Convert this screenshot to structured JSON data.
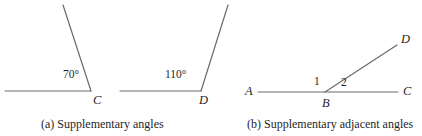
{
  "figure": {
    "background_color": "#ffffff",
    "stroke_color": "#6a6a6a",
    "text_color": "#1f1f1f",
    "panels": [
      {
        "id": "panel-a",
        "caption": "(a) Supplementary angles",
        "sub_figures": [
          {
            "id": "angle-70",
            "vertex_label": "C",
            "angle_measure": "70°",
            "angle_value": 70
          },
          {
            "id": "angle-110",
            "vertex_label": "D",
            "angle_measure": "110°",
            "angle_value": 110
          }
        ]
      },
      {
        "id": "panel-b",
        "caption": "(b) Supplementary adjacent angles",
        "sub_figures": [
          {
            "id": "adjacent-angles",
            "endpoint_left_label": "A",
            "vertex_label": "B",
            "endpoint_right_label": "C",
            "ray_label": "D",
            "angle_1_label": "1",
            "angle_2_label": "2"
          }
        ]
      }
    ]
  },
  "labels": {
    "a_angle_70": "70°",
    "a_vertex_c": "C",
    "a_angle_110": "110°",
    "a_vertex_d": "D",
    "b_point_a": "A",
    "b_point_b": "B",
    "b_point_c": "C",
    "b_point_d": "D",
    "b_angle_1": "1",
    "b_angle_2": "2",
    "caption_a": "(a) Supplementary angles",
    "caption_b": "(b) Supplementary adjacent angles"
  }
}
